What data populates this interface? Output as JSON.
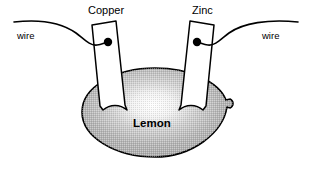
{
  "diagram": {
    "type": "labeled-schematic",
    "background_color": "#ffffff",
    "stroke_color": "#000000",
    "labels": {
      "copper": "Copper",
      "zinc": "Zinc",
      "wire_left": "wire",
      "wire_right": "wire",
      "lemon": "Lemon"
    },
    "parts": {
      "lemon_body": {
        "name": "Lemon",
        "shape": "ellipse",
        "fill_color": "#b3b3b3",
        "highlight_color": "#ffffff",
        "outline_color": "#000000",
        "center": [
          155,
          112
        ],
        "radius_x": 73,
        "radius_y": 45
      },
      "copper_electrode": {
        "name": "Copper",
        "shape": "tilted-strip",
        "fill_color": "#ffffff",
        "outline_color": "#000000",
        "lean": "right"
      },
      "zinc_electrode": {
        "name": "Zinc",
        "shape": "tilted-strip",
        "fill_color": "#ffffff",
        "outline_color": "#000000",
        "lean": "left"
      },
      "copper_contact_dot": {
        "name": "contact point",
        "shape": "filled-circle",
        "fill_color": "#000000",
        "center": [
          108,
          42
        ],
        "radius": 4
      },
      "zinc_contact_dot": {
        "name": "contact point",
        "shape": "filled-circle",
        "fill_color": "#000000",
        "center": [
          197,
          42
        ],
        "radius": 4
      },
      "wire_left": {
        "name": "wire",
        "shape": "wavy-curve",
        "stroke_color": "#000000",
        "from": [
          14,
          22
        ],
        "to": [
          108,
          42
        ]
      },
      "wire_right": {
        "name": "wire",
        "shape": "wavy-curve",
        "stroke_color": "#000000",
        "from": [
          197,
          42
        ],
        "to": [
          298,
          22
        ]
      }
    }
  }
}
